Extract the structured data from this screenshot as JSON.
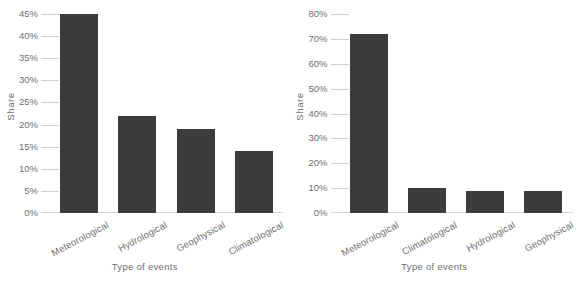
{
  "chart_data": [
    {
      "type": "bar",
      "panel": "left",
      "title": "",
      "xlabel": "Type of events",
      "ylabel": "Share",
      "categories": [
        "Meteorological",
        "Hydrological",
        "Geophysical",
        "Climatological"
      ],
      "values": [
        45,
        22,
        19,
        14
      ],
      "value_labels": [
        "45%",
        "22%",
        "19%",
        "14%"
      ],
      "ylim": [
        0,
        45
      ],
      "ytick_values": [
        0,
        5,
        10,
        15,
        20,
        25,
        30,
        35,
        40,
        45
      ],
      "ytick_labels": [
        "0%",
        "5%",
        "10%",
        "15%",
        "20%",
        "25%",
        "30%",
        "35%",
        "40%",
        "45%"
      ],
      "grid": false,
      "legend": null,
      "bar_color": "#3c3c3c",
      "tick_color": "#cfcfcf",
      "text_color": "#6e6e6e",
      "background": "#ffffff"
    },
    {
      "type": "bar",
      "panel": "right",
      "title": "",
      "xlabel": "Type of events",
      "ylabel": "Share",
      "categories": [
        "Meteorological",
        "Climatological",
        "Hydrological",
        "Geophysical"
      ],
      "values": [
        72,
        10,
        9,
        9
      ],
      "value_labels": [
        "72%",
        "10%",
        "9%",
        "9%"
      ],
      "ylim": [
        0,
        80
      ],
      "ytick_values": [
        0,
        10,
        20,
        30,
        40,
        50,
        60,
        70,
        80
      ],
      "ytick_labels": [
        "0%",
        "10%",
        "20%",
        "30%",
        "40%",
        "50%",
        "60%",
        "70%",
        "80%"
      ],
      "grid": false,
      "legend": null,
      "bar_color": "#3c3c3c",
      "tick_color": "#cfcfcf",
      "text_color": "#6e6e6e",
      "background": "#ffffff"
    }
  ]
}
